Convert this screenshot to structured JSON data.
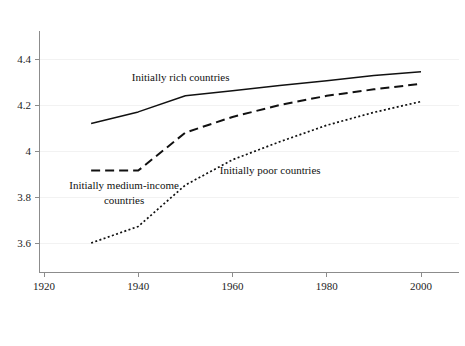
{
  "figure": {
    "clipped_header_text": "",
    "background_color": "#ffffff",
    "line_color": "#111111",
    "axis_color": "#8c8c8c",
    "grid_color": "#f2f2f2"
  },
  "chart_data": {
    "type": "line",
    "title": "",
    "xlabel": "",
    "ylabel": "",
    "xlim": [
      1918,
      2008
    ],
    "ylim": [
      3.47,
      4.52
    ],
    "grid": true,
    "legend": "annotations-inline",
    "x": [
      1930,
      1940,
      1950,
      1960,
      1970,
      1980,
      1990,
      2000
    ],
    "xticks": [
      1920,
      1940,
      1960,
      1980,
      2000
    ],
    "xticklabels": [
      "1920",
      "1940",
      "1960",
      "1980",
      "2000"
    ],
    "yticks": [
      3.6,
      3.8,
      4.0,
      4.2,
      4.4
    ],
    "yticklabels": [
      "3.6",
      "3.8",
      "4",
      "4.2",
      "4.4"
    ],
    "series": [
      {
        "name": "Initially rich countries",
        "style": "solid",
        "label_x": 1949,
        "label_y": 4.305,
        "values": [
          4.12,
          4.17,
          4.24,
          4.262,
          4.285,
          4.305,
          4.328,
          4.345
        ]
      },
      {
        "name": "Initially medium-income countries",
        "style": "dashed",
        "label_line1": "Initially medium-income",
        "label_line2": "countries",
        "label_x": 1937,
        "label_y": 3.833,
        "values": [
          3.915,
          3.915,
          4.08,
          4.148,
          4.2,
          4.24,
          4.268,
          4.292
        ]
      },
      {
        "name": "Initially poor countries",
        "style": "dotted",
        "label_x": 1968,
        "label_y": 3.9,
        "values": [
          3.6,
          3.672,
          3.852,
          3.962,
          4.04,
          4.112,
          4.168,
          4.215
        ]
      }
    ]
  }
}
